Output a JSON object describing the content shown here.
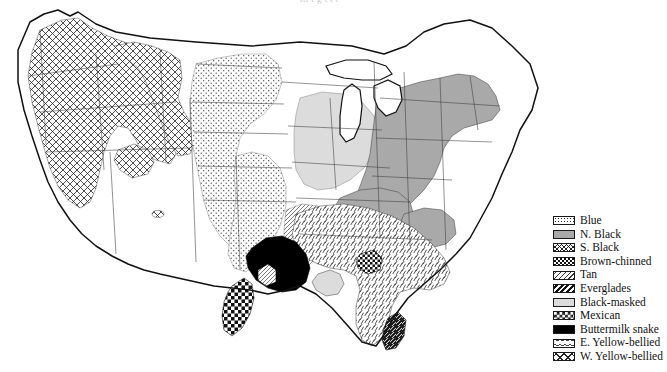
{
  "figure": {
    "kind": "distribution-range-map",
    "region": "Continental United States",
    "cut_caption": "ttt t g t t t"
  },
  "legend": {
    "items": [
      {
        "label": "Blue",
        "pattern": "fine-stipple-dots",
        "swatch_class": "sw-blue"
      },
      {
        "label": "N. Black",
        "pattern": "solid-medium-gray",
        "swatch_class": "sw-nblack"
      },
      {
        "label": "S. Black",
        "pattern": "fine-crosshatch",
        "swatch_class": "sw-sblack"
      },
      {
        "label": "Brown-chinned",
        "pattern": "fine-checkerboard",
        "swatch_class": "sw-brown"
      },
      {
        "label": "Tan",
        "pattern": "diagonal-hatch",
        "swatch_class": "sw-tan"
      },
      {
        "label": "Everglades",
        "pattern": "bold-diagonal-stripes",
        "swatch_class": "sw-ever"
      },
      {
        "label": "Black-masked",
        "pattern": "solid-light-gray",
        "swatch_class": "sw-bmask"
      },
      {
        "label": "Mexican",
        "pattern": "coarse-checkerboard",
        "swatch_class": "sw-mex"
      },
      {
        "label": "Buttermilk snake",
        "pattern": "solid-black",
        "swatch_class": "sw-butter"
      },
      {
        "label": "E. Yellow-bellied",
        "pattern": "sparse-dash-ticks",
        "swatch_class": "sw-eyellow"
      },
      {
        "label": "W. Yellow-bellied",
        "pattern": "coarse-crosshatch",
        "swatch_class": "sw-wyellow"
      }
    ]
  },
  "colors": {
    "outline": "#111111",
    "state_border": "#4a4a4a",
    "n_black_gray": "#a9a9a9",
    "black_masked_gray": "#dcdcdc",
    "buttermilk_black": "#000000",
    "page_background": "#ffffff"
  }
}
